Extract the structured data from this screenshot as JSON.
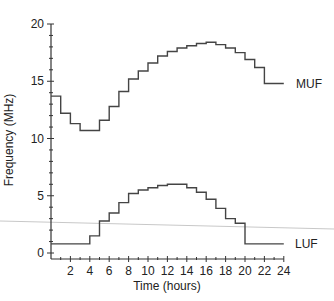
{
  "chart_data": {
    "type": "line",
    "step": true,
    "title": "",
    "xlabel": "Time (hours)",
    "ylabel": "Frequency (MHz)",
    "xlim": [
      0,
      24
    ],
    "ylim": [
      0,
      20
    ],
    "x_ticks": [
      2,
      4,
      6,
      8,
      10,
      12,
      14,
      16,
      18,
      20,
      22,
      24
    ],
    "y_ticks": [
      0,
      5,
      10,
      15,
      20
    ],
    "grid": false,
    "legend": "inline labels at right end of each series",
    "x": [
      0,
      1,
      2,
      3,
      4,
      5,
      6,
      7,
      8,
      9,
      10,
      11,
      12,
      13,
      14,
      15,
      16,
      17,
      18,
      19,
      20,
      21,
      22,
      23
    ],
    "series": [
      {
        "name": "MUF",
        "values": [
          13.7,
          12.2,
          11.3,
          10.7,
          10.7,
          11.6,
          12.8,
          14.1,
          15.2,
          15.9,
          16.6,
          17.2,
          17.6,
          17.9,
          18.1,
          18.3,
          18.4,
          18.2,
          17.9,
          17.5,
          16.9,
          16.2,
          14.8,
          14.8
        ]
      },
      {
        "name": "LUF",
        "values": [
          0.8,
          0.8,
          0.8,
          0.8,
          1.5,
          2.8,
          3.5,
          4.4,
          5.2,
          5.5,
          5.7,
          5.9,
          6.0,
          6.0,
          5.7,
          5.3,
          4.7,
          3.9,
          3.0,
          2.6,
          0.8,
          0.8,
          0.8,
          0.8
        ]
      }
    ],
    "annotations": [
      "MUF",
      "LUF"
    ]
  },
  "labels": {
    "xlabel": "Time (hours)",
    "ylabel": "Frequency (MHz)",
    "muf": "MUF",
    "luf": "LUF"
  }
}
